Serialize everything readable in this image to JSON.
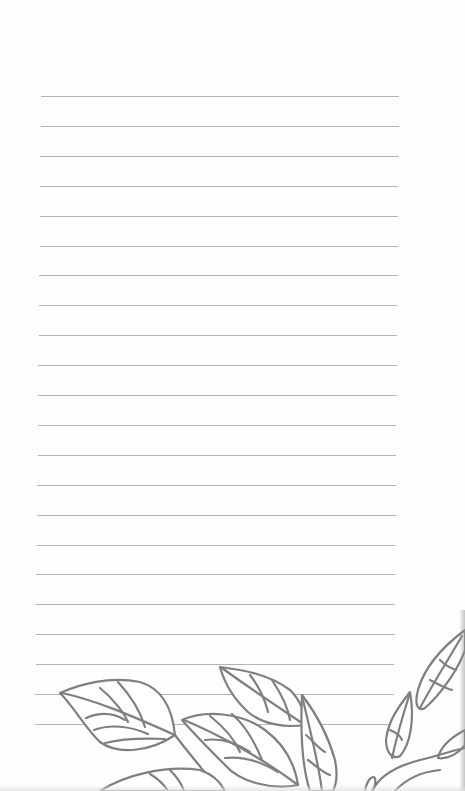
{
  "page": {
    "type": "lined-notepad",
    "background_color": "#fefefe",
    "line_color": "#b4b4b4",
    "illustration_color": "#7f7f7f"
  },
  "ruled_lines": {
    "count": 22,
    "first_y": 96,
    "spacing": 29.9,
    "left_start": 41,
    "left_end": 35,
    "right_start": 399,
    "right_end": 394
  },
  "illustration": {
    "subject": "leaf-branch-line-art",
    "position": "bottom"
  }
}
